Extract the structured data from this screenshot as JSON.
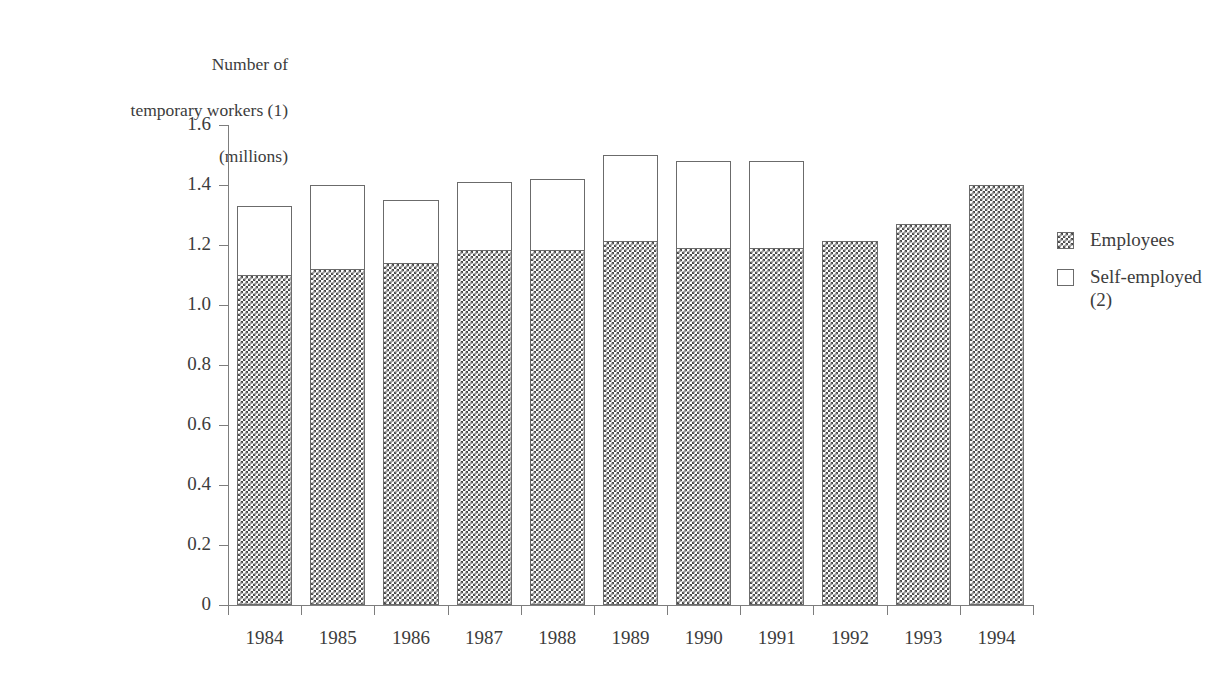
{
  "chart_data": {
    "type": "bar",
    "subtype": "stacked-vertical",
    "title": "",
    "ylabel": "Number of\ntemporary workers (1)\n(millions)",
    "ylabel_lines": [
      "Number of",
      "temporary workers (1)",
      "(millions)"
    ],
    "xlabel": "",
    "categories": [
      "1984",
      "1985",
      "1986",
      "1987",
      "1988",
      "1989",
      "1990",
      "1991",
      "1992",
      "1993",
      "1994"
    ],
    "series": [
      {
        "name": "Employees",
        "swatch": "hatched",
        "values": [
          1.1,
          1.12,
          1.14,
          1.185,
          1.185,
          1.215,
          1.19,
          1.19,
          1.215,
          1.27,
          1.4
        ]
      },
      {
        "name": "Self-employed\n(2)",
        "swatch": "white",
        "values": [
          0.23,
          0.28,
          0.21,
          0.225,
          0.235,
          0.285,
          0.29,
          0.29,
          0,
          0,
          0
        ]
      }
    ],
    "totals": [
      1.33,
      1.4,
      1.35,
      1.41,
      1.42,
      1.5,
      1.48,
      1.48,
      1.215,
      1.27,
      1.4
    ],
    "ylim": [
      0,
      1.6
    ],
    "yticks": [
      0,
      0.2,
      0.4,
      0.6,
      0.8,
      1.0,
      1.2,
      1.4,
      1.6
    ],
    "ytick_labels": [
      "0",
      "0.2",
      "0.4",
      "0.6",
      "0.8",
      "1.0",
      "1.2",
      "1.4",
      "1.6"
    ],
    "grid": false,
    "legend_position": "right",
    "colors": {
      "axis": "#7d7d7d",
      "text": "#3c3c3c",
      "bar_outline": "#6b6b6b",
      "hatch": "#4a4a4a",
      "background": "#ffffff"
    }
  },
  "legend": {
    "items": [
      {
        "label": "Employees",
        "swatch": "hatched"
      },
      {
        "label": "Self-employed\n(2)",
        "swatch": "white"
      }
    ]
  }
}
